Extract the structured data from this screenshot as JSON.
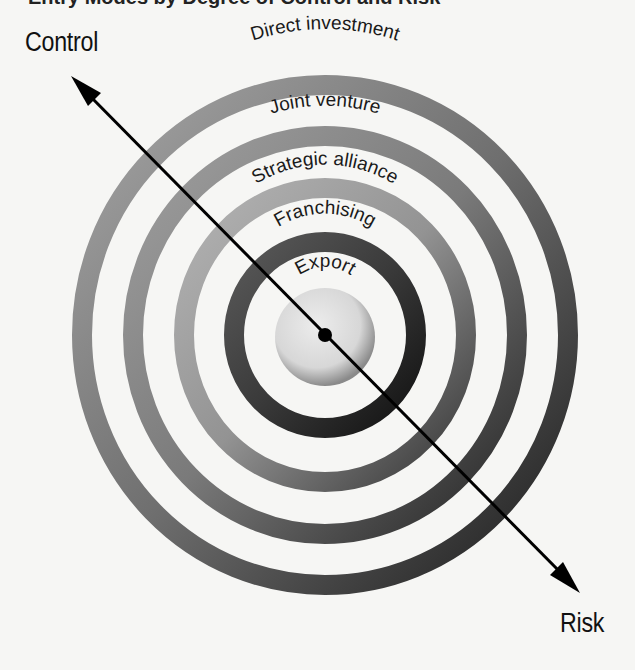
{
  "heading": {
    "text": "Entry Modes by Degree of Control and Risk"
  },
  "axis": {
    "top_left_label": "Control",
    "bottom_right_label": "Risk"
  },
  "rings": [
    {
      "label": "Direct investment",
      "order": 1,
      "color": "#7a7a7a"
    },
    {
      "label": "Joint venture",
      "order": 2,
      "color": "#8a8a8a"
    },
    {
      "label": "Strategic alliance",
      "order": 3,
      "color": "#9c9c9c"
    },
    {
      "label": "Franchising",
      "order": 4,
      "color": "#3c3c3c"
    },
    {
      "label": "Export",
      "order": 5,
      "color": "#d9d9d9"
    }
  ],
  "colors": {
    "background": "#f6f6f4",
    "arrow": "#000000"
  }
}
